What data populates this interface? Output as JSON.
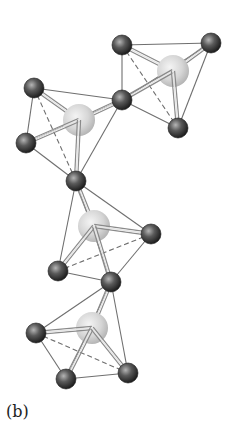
{
  "figure": {
    "panel_label": "(b)",
    "colors": {
      "background": "#ffffff",
      "small_atom_dark": "#2e2e2e",
      "small_atom_light": "#9a9a9a",
      "central_atom_light": "#f0f0f0",
      "central_atom_dark": "#b9b9b9",
      "edge_line": "#6f6f6f",
      "bond_line": "#8a8a8a"
    },
    "tetrahedra": [
      {
        "name": "top-right",
        "center": [
          173,
          71
        ],
        "vertices": [
          [
            122,
            45
          ],
          [
            211,
            43
          ],
          [
            122,
            100
          ],
          [
            178,
            128
          ]
        ],
        "hidden_edge": [
          0,
          3
        ]
      },
      {
        "name": "top-left",
        "center": [
          79,
          120
        ],
        "vertices": [
          [
            34,
            88
          ],
          [
            26,
            143
          ],
          [
            122,
            100
          ],
          [
            76,
            181
          ]
        ],
        "hidden_edge": [
          0,
          3
        ]
      },
      {
        "name": "middle",
        "center": [
          94,
          226
        ],
        "vertices": [
          [
            76,
            181
          ],
          [
            151,
            234
          ],
          [
            58,
            271
          ],
          [
            111,
            282
          ]
        ],
        "hidden_edge": [
          1,
          2
        ]
      },
      {
        "name": "bottom",
        "center": [
          92,
          328
        ],
        "vertices": [
          [
            111,
            282
          ],
          [
            36,
            333
          ],
          [
            66,
            379
          ],
          [
            128,
            373
          ]
        ],
        "hidden_edge": [
          1,
          3
        ]
      }
    ]
  }
}
